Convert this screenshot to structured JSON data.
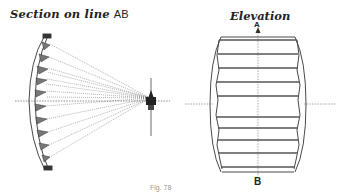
{
  "section": {
    "title": "Section on line",
    "line_label": "AB"
  },
  "elevation": {
    "title": "Elevation",
    "top_mark": "A",
    "bottom_mark": "B"
  },
  "caption": "Fig. 78",
  "colors": {
    "ink": "#333333",
    "prism_fill": "#777777",
    "background": "#ffffff"
  }
}
